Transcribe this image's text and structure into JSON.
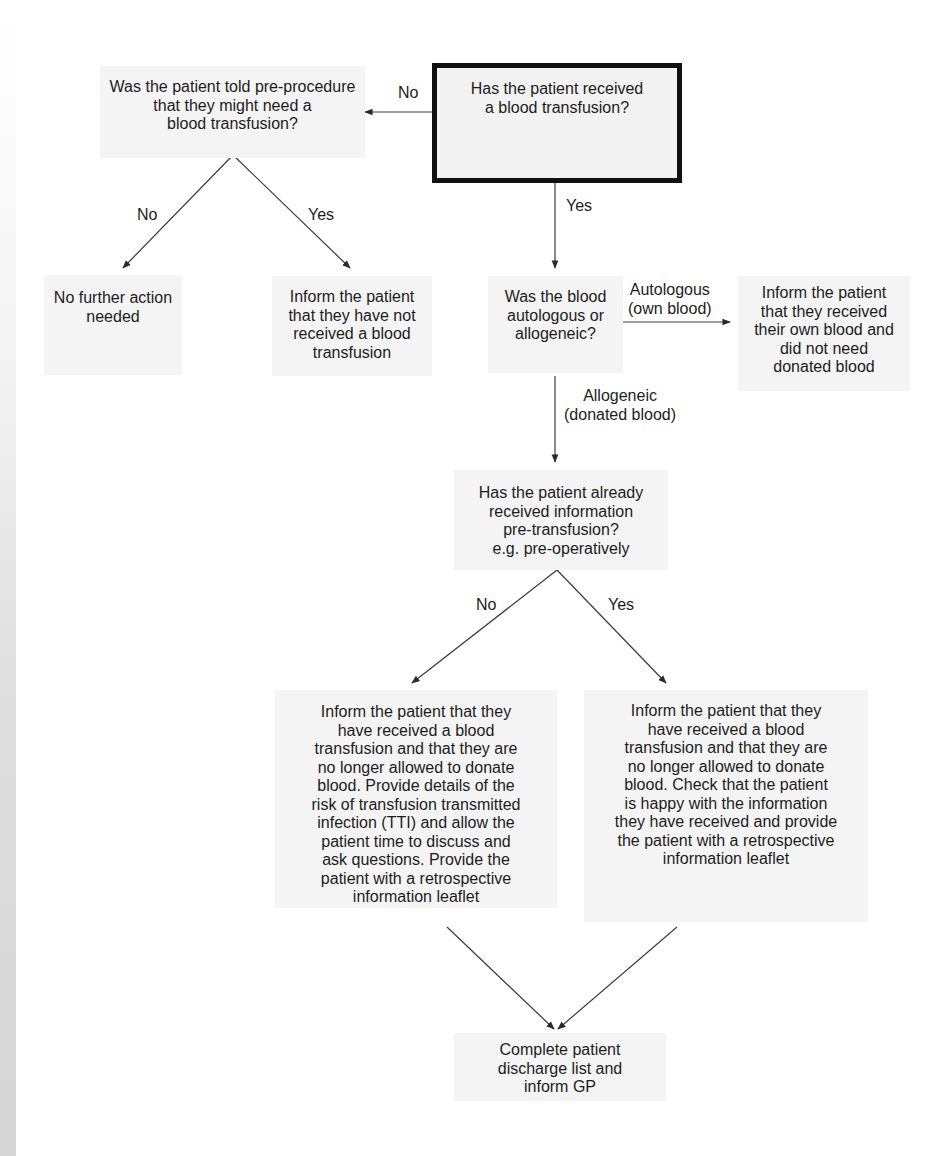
{
  "diagram": {
    "type": "flowchart",
    "nodes": {
      "start": {
        "id": "start",
        "text": "Has the patient received\na blood transfusion?"
      },
      "told_pre": {
        "id": "told_pre",
        "text": "Was the patient told pre-procedure\nthat they might need a\nblood transfusion?"
      },
      "no_action": {
        "id": "no_action",
        "text": "No further action\nneeded"
      },
      "inform_not_received": {
        "id": "inform_not_received",
        "text": "Inform the patient\nthat they have not\nreceived a blood\ntransfusion"
      },
      "auto_or_allo": {
        "id": "auto_or_allo",
        "text": "Was the blood\nautologous or\nallogeneic?"
      },
      "inform_own_blood": {
        "id": "inform_own_blood",
        "text": "Inform the patient\nthat they received\ntheir own blood and\ndid not need\ndonated blood"
      },
      "already_info": {
        "id": "already_info",
        "text": "Has the patient already\nreceived information\npre-transfusion?\ne.g. pre-operatively"
      },
      "inform_tti": {
        "id": "inform_tti",
        "text": "Inform the patient that they\nhave received a blood\ntransfusion and that they are\nno longer allowed to donate\nblood. Provide details of the\nrisk of transfusion transmitted\ninfection (TTI) and allow the\npatient time to discuss and\nask questions. Provide the\npatient with a retrospective\ninformation leaflet"
      },
      "inform_check": {
        "id": "inform_check",
        "text": "Inform the patient that they\nhave received a blood\ntransfusion and that they are\nno longer allowed to donate\nblood. Check that the patient\nis happy with the information\nthey have received and provide\nthe patient with a retrospective\ninformation leaflet"
      },
      "discharge": {
        "id": "discharge",
        "text": "Complete patient\ndischarge list and\ninform GP"
      }
    },
    "edges": [
      {
        "from": "start",
        "to": "told_pre",
        "label": "No"
      },
      {
        "from": "start",
        "to": "auto_or_allo",
        "label": "Yes"
      },
      {
        "from": "told_pre",
        "to": "no_action",
        "label": "No"
      },
      {
        "from": "told_pre",
        "to": "inform_not_received",
        "label": "Yes"
      },
      {
        "from": "auto_or_allo",
        "to": "inform_own_blood",
        "label": "Autologous\n(own blood)"
      },
      {
        "from": "auto_or_allo",
        "to": "already_info",
        "label": "Allogeneic\n(donated blood)"
      },
      {
        "from": "already_info",
        "to": "inform_tti",
        "label": "No"
      },
      {
        "from": "already_info",
        "to": "inform_check",
        "label": "Yes"
      },
      {
        "from": "inform_tti",
        "to": "discharge",
        "label": ""
      },
      {
        "from": "inform_check",
        "to": "discharge",
        "label": ""
      }
    ],
    "labels": {
      "start_no": "No",
      "start_yes": "Yes",
      "told_no": "No",
      "told_yes": "Yes",
      "autologous": "Autologous\n(own blood)",
      "allogeneic": "Allogeneic\n(donated blood)",
      "info_no": "No",
      "info_yes": "Yes"
    },
    "colors": {
      "node_fill": "#f4f4f4",
      "start_border": "#111111",
      "line": "#3a3a3a",
      "text": "#1c1c1c"
    }
  }
}
